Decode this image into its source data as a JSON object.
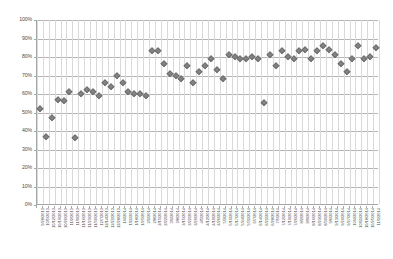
{
  "chart_data": {
    "type": "scatter",
    "title": "",
    "xlabel": "",
    "ylabel": "",
    "ylim": [
      0,
      100
    ],
    "y_unit": "%",
    "grid": true,
    "legend": false,
    "marker_color": "#848484",
    "marker_shape": "diamond",
    "yticks": [
      "0%",
      "10%",
      "20%",
      "30%",
      "40%",
      "50%",
      "60%",
      "70%",
      "80%",
      "90%",
      "100%"
    ],
    "ytick_values": [
      0,
      10,
      20,
      30,
      40,
      50,
      60,
      70,
      80,
      90,
      100
    ],
    "categories": [
      "9/28/2013",
      "10/5/2013",
      "10/12/2013",
      "10/19/2013",
      "10/26/2013",
      "11/2/2013",
      "11/9/2013",
      "11/16/2013",
      "11/23/2013",
      "11/30/2013",
      "12/7/2013",
      "12/14/2013",
      "12/21/2013",
      "12/28/2013",
      "1/4/2014",
      "1/11/2014",
      "1/18/2014",
      "1/25/2014",
      "2/1/2014",
      "2/8/2014",
      "2/15/2014",
      "2/22/2014",
      "3/1/2014",
      "3/8/2014",
      "3/15/2014",
      "3/22/2014",
      "3/29/2014",
      "4/5/2014",
      "4/12/2014",
      "4/19/2014",
      "4/26/2014",
      "5/3/2014",
      "5/10/2014",
      "5/17/2014",
      "5/24/2014",
      "5/31/2014",
      "6/7/2014",
      "6/14/2014",
      "6/21/2014",
      "6/28/2014",
      "7/5/2014",
      "7/12/2014",
      "7/19/2014",
      "7/26/2014",
      "8/2/2014",
      "8/9/2014",
      "8/16/2014",
      "8/23/2014",
      "8/30/2014",
      "9/6/2014",
      "9/13/2014",
      "9/20/2014",
      "9/27/2014",
      "10/4/2014",
      "10/11/2014",
      "10/18/2014",
      "10/25/2014",
      "11/1/2014"
    ],
    "values": [
      52,
      37,
      47,
      57,
      56,
      61,
      36,
      60,
      62,
      61,
      59,
      66,
      64,
      70,
      66,
      61,
      60,
      60,
      59,
      83,
      83,
      76,
      71,
      70,
      68,
      75,
      66,
      72,
      75,
      79,
      73,
      68,
      81,
      80,
      79,
      79,
      80,
      79,
      55,
      81,
      75,
      83,
      80,
      79,
      83,
      84,
      79,
      83,
      86,
      84,
      81,
      76,
      72,
      79,
      86,
      79,
      80,
      85
    ]
  }
}
